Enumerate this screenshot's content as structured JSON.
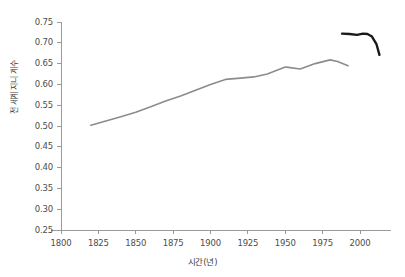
{
  "chart_data": {
    "type": "line",
    "title": "",
    "xlabel": "시간(년)",
    "ylabel": "전 세계 지니 계수",
    "xlim": [
      1793,
      2021
    ],
    "ylim": [
      0.25,
      0.75
    ],
    "grid": false,
    "legend": "none",
    "xticks": [
      1800,
      1825,
      1850,
      1875,
      1900,
      1925,
      1950,
      1975,
      2000
    ],
    "xtick_labels": [
      "1800",
      "1825",
      "1850",
      "1875",
      "1900",
      "1925",
      "1950",
      "1975",
      "2000"
    ],
    "yticks": [
      0.25,
      0.3,
      0.35,
      0.4,
      0.45,
      0.5,
      0.55,
      0.6,
      0.65,
      0.7,
      0.75
    ],
    "ytick_labels": [
      "0.25",
      "0.30",
      "0.35",
      "0.40",
      "0.45",
      "0.50",
      "0.55",
      "0.60",
      "0.65",
      "0.70",
      "0.75"
    ],
    "series": [
      {
        "name": "historical-gini",
        "color": "#8c8c8c",
        "width": 1.6,
        "x": [
          1820,
          1830,
          1840,
          1850,
          1860,
          1870,
          1880,
          1890,
          1900,
          1910,
          1920,
          1929,
          1938,
          1950,
          1952,
          1960,
          1970,
          1980,
          1985,
          1992
        ],
        "y": [
          0.502,
          0.512,
          0.522,
          0.533,
          0.546,
          0.56,
          0.572,
          0.586,
          0.6,
          0.612,
          0.615,
          0.618,
          0.625,
          0.642,
          0.641,
          0.637,
          0.65,
          0.659,
          0.655,
          0.645
        ]
      },
      {
        "name": "recent-gini",
        "color": "#1a1a1a",
        "width": 2.4,
        "x": [
          1988,
          1993,
          1998,
          2002,
          2005,
          2008,
          2011,
          2013
        ],
        "y": [
          0.722,
          0.721,
          0.719,
          0.722,
          0.721,
          0.715,
          0.697,
          0.671
        ]
      }
    ]
  },
  "axis": {
    "spine_color": "#9a9a9a",
    "tick_color": "#9a9a9a",
    "label_color": "#4d4d4d"
  }
}
